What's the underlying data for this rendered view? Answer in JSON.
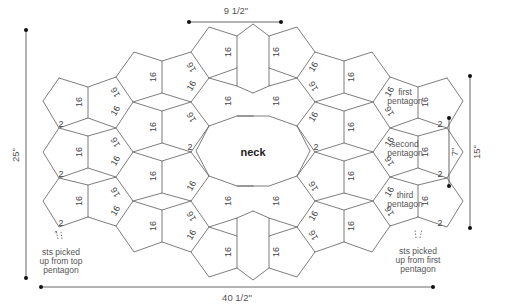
{
  "center_label": "neck",
  "dimensions": {
    "top_width": "9 1/2\"",
    "bottom_width": "40 1/2\"",
    "left_height": "25\"",
    "right_inner_height": "7\"",
    "right_outer_height": "15\""
  },
  "labels": {
    "first_pentagon": [
      "first",
      "pentagon"
    ],
    "second_pentagon": [
      "second",
      "pentagon"
    ],
    "third_pentagon": [
      "third",
      "pentagon"
    ],
    "left_note": [
      "sts picked",
      "up from top",
      "pentagon"
    ],
    "right_note": [
      "sts picked",
      "up from first",
      "pentagon"
    ]
  },
  "edge_stitch_counts": {
    "standard": "16",
    "pickup": "2"
  }
}
